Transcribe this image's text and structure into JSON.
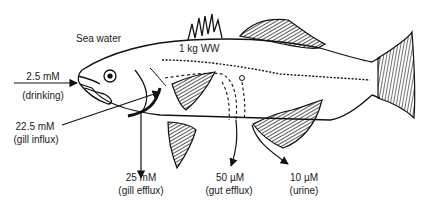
{
  "diagram": {
    "environment_label": "Sea water",
    "body_label": "1 kg WW",
    "fluxes": [
      {
        "id": "drinking",
        "value": "2.5 mM",
        "label": "(drinking)",
        "direction": "in"
      },
      {
        "id": "gill_influx",
        "value": "22.5 mM",
        "label": "(gill influx)",
        "direction": "in"
      },
      {
        "id": "gill_efflux",
        "value": "25 mM",
        "label": "(gill efflux)",
        "direction": "out"
      },
      {
        "id": "gut_efflux",
        "value": "50 µM",
        "label": "(gut efflux)",
        "direction": "out"
      },
      {
        "id": "urine",
        "value": "10 µM",
        "label": "(urine)",
        "direction": "out"
      }
    ],
    "colors": {
      "line": "#111111",
      "background": "#ffffff"
    }
  }
}
